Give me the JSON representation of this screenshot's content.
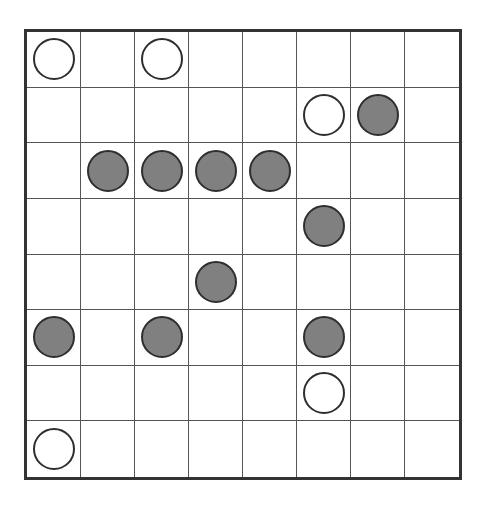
{
  "board": {
    "rows": 8,
    "cols": 8,
    "colors": {
      "white": "#ffffff",
      "gray": "#808080",
      "outline": "#2e2e2e",
      "grid": "#555555",
      "border": "#333333"
    },
    "pieces": [
      {
        "row": 0,
        "col": 0,
        "color": "white"
      },
      {
        "row": 0,
        "col": 2,
        "color": "white"
      },
      {
        "row": 1,
        "col": 5,
        "color": "white"
      },
      {
        "row": 1,
        "col": 6,
        "color": "gray"
      },
      {
        "row": 2,
        "col": 1,
        "color": "gray"
      },
      {
        "row": 2,
        "col": 2,
        "color": "gray"
      },
      {
        "row": 2,
        "col": 3,
        "color": "gray"
      },
      {
        "row": 2,
        "col": 4,
        "color": "gray"
      },
      {
        "row": 3,
        "col": 5,
        "color": "gray"
      },
      {
        "row": 4,
        "col": 3,
        "color": "gray"
      },
      {
        "row": 5,
        "col": 0,
        "color": "gray"
      },
      {
        "row": 5,
        "col": 2,
        "color": "gray"
      },
      {
        "row": 5,
        "col": 5,
        "color": "gray"
      },
      {
        "row": 6,
        "col": 5,
        "color": "white"
      },
      {
        "row": 7,
        "col": 0,
        "color": "white"
      }
    ]
  }
}
